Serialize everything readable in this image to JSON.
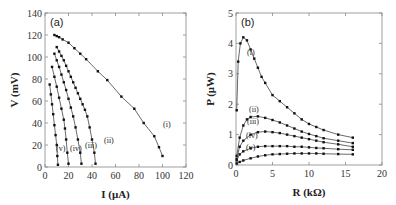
{
  "chart_data": [
    {
      "type": "line",
      "panel_label": "(a)",
      "xlabel": "I (μA)",
      "ylabel": "V (mV)",
      "xlim": [
        0,
        120
      ],
      "ylim": [
        0,
        140
      ],
      "xticks": [
        "0",
        "20",
        "40",
        "60",
        "80",
        "100",
        "120"
      ],
      "yticks": [
        "0",
        "20",
        "40",
        "60",
        "80",
        "100",
        "120",
        "140"
      ],
      "grid": false,
      "series": [
        {
          "name": "(i)",
          "x": [
            8,
            10,
            12,
            15,
            20,
            25,
            30,
            35,
            45,
            53,
            65,
            76,
            84,
            93,
            97,
            100
          ],
          "y": [
            120,
            119,
            118,
            116,
            113,
            108,
            103,
            98,
            87,
            79,
            64,
            53,
            40,
            28,
            18,
            10
          ]
        },
        {
          "name": "(ii)",
          "x": [
            10,
            12,
            14,
            16,
            18,
            20,
            22,
            24,
            26,
            28,
            30,
            32,
            34,
            36,
            38,
            40,
            42,
            43
          ],
          "y": [
            109,
            105,
            101,
            97,
            92,
            87,
            82,
            77,
            72,
            67,
            62,
            57,
            52,
            46,
            36,
            25,
            13,
            3
          ]
        },
        {
          "name": "(iii)",
          "x": [
            8,
            10,
            12,
            14,
            16,
            18,
            20,
            22,
            24,
            26,
            28,
            30,
            31
          ],
          "y": [
            103,
            97,
            91,
            84,
            77,
            70,
            62,
            54,
            46,
            36,
            25,
            13,
            3
          ]
        },
        {
          "name": "(iv)",
          "x": [
            6,
            8,
            10,
            12,
            14,
            16,
            17,
            18,
            19,
            20
          ],
          "y": [
            91,
            82,
            73,
            63,
            53,
            43,
            35,
            25,
            13,
            3
          ]
        },
        {
          "name": "(v)",
          "x": [
            4,
            5,
            6,
            7,
            8,
            9,
            10,
            10.5,
            11
          ],
          "y": [
            75,
            66,
            57,
            48,
            38,
            29,
            20,
            10,
            2
          ]
        }
      ]
    },
    {
      "type": "line",
      "panel_label": "(b)",
      "xlabel": "R (kΩ)",
      "ylabel": "P (μW)",
      "xlim": [
        0,
        20
      ],
      "ylim": [
        0,
        5
      ],
      "xticks": [
        "0",
        "5",
        "10",
        "15",
        "20"
      ],
      "yticks": [
        "0",
        "1",
        "2",
        "3",
        "4",
        "5"
      ],
      "grid": false,
      "series": [
        {
          "name": "(i)",
          "x": [
            0.1,
            0.3,
            0.6,
            1.0,
            1.5,
            2.0,
            2.5,
            3,
            3.5,
            4,
            5,
            6,
            7,
            8,
            9,
            10,
            11,
            12,
            14,
            16
          ],
          "y": [
            1.8,
            3.4,
            4.0,
            4.2,
            4.1,
            3.8,
            3.5,
            3.2,
            2.9,
            2.7,
            2.3,
            2.1,
            1.9,
            1.7,
            1.5,
            1.35,
            1.25,
            1.15,
            1.0,
            0.9
          ]
        },
        {
          "name": "(ii)",
          "x": [
            0.1,
            0.5,
            1,
            1.5,
            2,
            3,
            4,
            5,
            6,
            7,
            8,
            9,
            10,
            11,
            12,
            14,
            16
          ],
          "y": [
            0.3,
            0.9,
            1.3,
            1.5,
            1.58,
            1.6,
            1.55,
            1.48,
            1.4,
            1.3,
            1.2,
            1.1,
            1.02,
            0.95,
            0.88,
            0.8,
            0.72
          ]
        },
        {
          "name": "(iii)",
          "x": [
            0.1,
            0.5,
            1,
            2,
            3,
            4,
            5,
            6,
            7,
            8,
            9,
            10,
            11,
            12,
            14,
            16
          ],
          "y": [
            0.2,
            0.6,
            0.8,
            1.0,
            1.08,
            1.1,
            1.08,
            1.05,
            1.0,
            0.95,
            0.9,
            0.85,
            0.8,
            0.75,
            0.68,
            0.6
          ]
        },
        {
          "name": "(iv)",
          "x": [
            0.1,
            0.5,
            1,
            2,
            3,
            4,
            5,
            6,
            7,
            8,
            9,
            10,
            11,
            12,
            14,
            16
          ],
          "y": [
            0.15,
            0.35,
            0.45,
            0.55,
            0.6,
            0.62,
            0.62,
            0.62,
            0.62,
            0.6,
            0.6,
            0.58,
            0.56,
            0.55,
            0.52,
            0.5
          ]
        },
        {
          "name": "(v)",
          "x": [
            0.1,
            0.5,
            1,
            2,
            3,
            4,
            5,
            6,
            7,
            8,
            9,
            10,
            11,
            12,
            14,
            16
          ],
          "y": [
            0.05,
            0.1,
            0.15,
            0.22,
            0.28,
            0.32,
            0.35,
            0.36,
            0.37,
            0.38,
            0.38,
            0.38,
            0.38,
            0.37,
            0.36,
            0.35
          ]
        }
      ]
    }
  ]
}
